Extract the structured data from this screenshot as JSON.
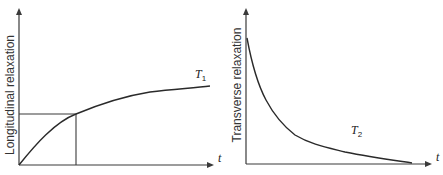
{
  "diagram": {
    "left_panel": {
      "y_axis_label": "Longitudinal relaxation",
      "x_axis_label": "t",
      "curve_label": "T",
      "curve_label_subscript": "1",
      "curve_type": "recovery"
    },
    "right_panel": {
      "y_axis_label": "Transverse relaxation",
      "x_axis_label": "t",
      "curve_label": "T",
      "curve_label_subscript": "2",
      "curve_type": "decay"
    },
    "colors": {
      "line": "#2a2a2a",
      "axis": "#3a3a3a",
      "background": "#ffffff"
    }
  }
}
